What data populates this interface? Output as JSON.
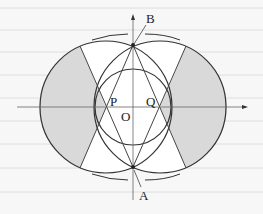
{
  "diagram": {
    "type": "geometry",
    "labels": {
      "B": "B",
      "A": "A",
      "P": "P",
      "Q": "Q",
      "O": "O"
    },
    "colors": {
      "background": "#f7f7f7",
      "ruled_lines": "#dcdcdc",
      "stroke": "#333333",
      "axis": "#555555",
      "shade": "#d9d9d9"
    },
    "points": {
      "O": [
        133,
        107
      ],
      "A": [
        133,
        167
      ],
      "B": [
        133,
        45
      ],
      "P": [
        106,
        107
      ],
      "Q": [
        160,
        107
      ]
    },
    "circles": [
      {
        "name": "left-circle",
        "cx": 106,
        "cy": 107,
        "r": 66
      },
      {
        "name": "right-circle",
        "cx": 160,
        "cy": 107,
        "r": 66
      },
      {
        "name": "center-circle",
        "cx": 133,
        "cy": 107,
        "r": 38
      }
    ]
  }
}
